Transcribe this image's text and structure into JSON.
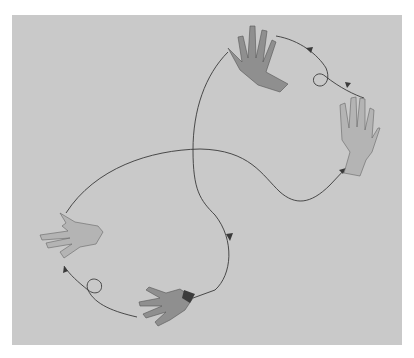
{
  "image": {
    "description": "Illustration of five disembodied hands connected by curved arrowed paths forming a looping figure-eight trajectory on a gray background",
    "background_color": "#c9c9c9",
    "line_color": "#3a3a3a",
    "hands": [
      {
        "id": "top-hand",
        "pose": "palm-back, fingers up, tilted left"
      },
      {
        "id": "right-hand",
        "pose": "open palm facing viewer, fingers up"
      },
      {
        "id": "left-hand",
        "pose": "palm up, fingers pointing left"
      },
      {
        "id": "bottom-hand",
        "pose": "back of hand, fingers pointing left-down, dark cuff"
      },
      {
        "id": "small-loops",
        "count": 2
      }
    ]
  }
}
